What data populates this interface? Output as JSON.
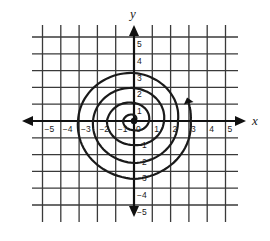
{
  "figure": {
    "x_axis_label": "x",
    "y_axis_label": "y",
    "x_range": [
      -5,
      5
    ],
    "y_range": [
      -5,
      5
    ],
    "x_tick_labels": [
      "-5",
      "-4",
      "-3",
      "-2",
      "-1",
      "0",
      "1",
      "2",
      "3",
      "4",
      "5"
    ],
    "y_tick_labels": [
      "5",
      "4",
      "3",
      "2",
      "1",
      "-1",
      "-2",
      "-3",
      "-4",
      "-5"
    ],
    "grid_color": "#3a3a3a",
    "curve_color": "#1a1a1a",
    "spiral": {
      "type": "archimedean",
      "direction": "counterclockwise",
      "start_point": [
        0,
        0
      ],
      "end_arrow_at": [
        3.1,
        1.0
      ],
      "turns": 4,
      "axis_crossings": [
        [
          0.0,
          0.36
        ],
        [
          -0.6,
          0.0
        ],
        [
          0.0,
          -0.54
        ],
        [
          0.82,
          0.0
        ],
        [
          0.0,
          1.07
        ],
        [
          -1.48,
          0.0
        ],
        [
          0.0,
          -1.43
        ],
        [
          1.64,
          0.0
        ],
        [
          0.0,
          1.96
        ],
        [
          -2.24,
          0.0
        ],
        [
          0.0,
          -2.5
        ],
        [
          2.4,
          0.0
        ],
        [
          0.0,
          2.86
        ],
        [
          -3.06,
          0.0
        ],
        [
          0.0,
          -3.45
        ],
        [
          3.1,
          0.0
        ]
      ]
    }
  },
  "layout": {
    "origin_px": [
      134,
      121
    ],
    "unit_x_px": 18.3,
    "unit_y_px": 16.8,
    "grid_x_extent_px": [
      32,
      238
    ],
    "grid_y_extent_px": [
      25,
      222
    ],
    "x_axis_arrow_px": [
      22,
      246
    ],
    "y_axis_arrow_px": [
      25,
      217
    ]
  }
}
